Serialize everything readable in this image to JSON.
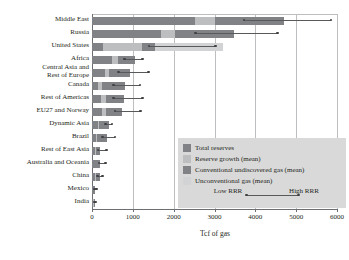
{
  "chart_data": {
    "type": "bar",
    "orientation": "horizontal",
    "stacked": true,
    "title": "",
    "xlabel": "Tcf of gas",
    "ylabel": "",
    "xlim": [
      0,
      6000
    ],
    "xticks": [
      0,
      1000,
      2000,
      3000,
      4000,
      5000,
      6000
    ],
    "xtick_labels": [
      "0",
      "1000",
      "2000",
      "3000",
      "4000",
      "5000",
      "6000"
    ],
    "grid": "vertical",
    "legend_position": "inside-lower-right",
    "categories": [
      "Middle East",
      "Russia",
      "United States",
      "Africa",
      "Central Asia and\nRest of Europe",
      "Canada",
      "Rest of Americas",
      "EU27 and Norway",
      "Dynamic Asia",
      "Brazil",
      "Rest of East Asia",
      "Australia and Oceania",
      "China",
      "Mexico",
      "India"
    ],
    "series": [
      {
        "name": "Total reserves",
        "color": "#808285",
        "values": [
          2530,
          1700,
          270,
          490,
          320,
          140,
          230,
          250,
          135,
          95,
          70,
          95,
          75,
          25,
          30
        ]
      },
      {
        "name": "Reserve growth (mean)",
        "color": "#bcbec0",
        "values": [
          480,
          340,
          950,
          150,
          105,
          105,
          105,
          90,
          45,
          30,
          25,
          15,
          25,
          10,
          10
        ]
      },
      {
        "name": "Conventional undiscovered gas (mean)",
        "color": "#808285",
        "values": [
          1690,
          1430,
          330,
          410,
          510,
          560,
          450,
          400,
          230,
          240,
          100,
          95,
          90,
          30,
          30
        ]
      },
      {
        "name": "Unconventional gas (mean)",
        "color": "#d1d3d4",
        "values": [
          0,
          0,
          1650,
          0,
          0,
          0,
          0,
          0,
          0,
          0,
          0,
          0,
          0,
          0,
          0
        ]
      }
    ],
    "rrr_ranges": {
      "name": "RRR range (Low RRR to High RRR)",
      "low": [
        3720,
        2530,
        1400,
        800,
        650,
        520,
        520,
        560,
        330,
        250,
        150,
        170,
        140,
        60,
        60
      ],
      "high": [
        5850,
        4540,
        3020,
        1240,
        1380,
        1180,
        1230,
        1190,
        490,
        560,
        350,
        330,
        260,
        110,
        100
      ]
    },
    "legend": {
      "entries": [
        {
          "label": "Total reserves",
          "color": "#808285"
        },
        {
          "label": "Reserve growth (mean)",
          "color": "#bcbec0"
        },
        {
          "label": "Conventional undiscovered gas (mean)",
          "color": "#808285"
        },
        {
          "label": "Unconventional gas (mean)",
          "color": "#d1d3d4"
        }
      ],
      "rrr_low_label": "Low\nRRR",
      "rrr_high_label": "High\nRRR",
      "background": "#d9d9d9"
    }
  },
  "axis": {
    "x_title": "Tcf of gas",
    "tick_0": "0",
    "tick_1": "1000",
    "tick_2": "2000",
    "tick_3": "3000",
    "tick_4": "4000",
    "tick_5": "5000",
    "tick_6": "6000"
  },
  "categories": {
    "c0": "Middle East",
    "c1": "Russia",
    "c2": "United States",
    "c3": "Africa",
    "c4": "Central Asia and\nRest of Europe",
    "c5": "Canada",
    "c6": "Rest of Americas",
    "c7": "EU27 and Norway",
    "c8": "Dynamic Asia",
    "c9": "Brazil",
    "c10": "Rest of East Asia",
    "c11": "Australia and Oceania",
    "c12": "China",
    "c13": "Mexico",
    "c14": "India"
  },
  "legend": {
    "e0": "Total reserves",
    "e1": "Reserve growth (mean)",
    "e2": "Conventional undiscovered gas (mean)",
    "e3": "Unconventional gas (mean)",
    "low": "Low\nRRR",
    "high": "High\nRRR"
  }
}
